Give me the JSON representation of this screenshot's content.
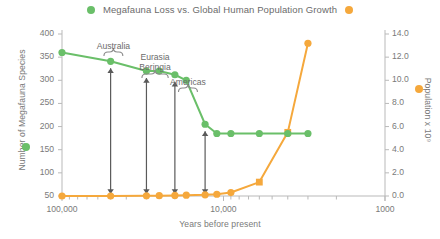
{
  "title": "Megafauna Loss vs. Global Human Population Growth",
  "colors": {
    "green": "#6abf69",
    "orange": "#f5a83c",
    "arrow": "#5a5a5a",
    "text": "#7a7a7a"
  },
  "legend": {
    "left_marker": "green-dot-icon",
    "right_marker": "orange-dot-icon"
  },
  "axes": {
    "xlabel": "Years before present",
    "ylabel_left": "Number of Megafauna Species",
    "ylabel_right": "Population x 10⁹",
    "x_ticks": [
      "100,000",
      "10,000",
      "1000"
    ],
    "y_ticks_left": [
      "400",
      "350",
      "300",
      "250",
      "200",
      "150",
      "100",
      "50"
    ],
    "y_ticks_right": [
      "14.0",
      "12.0",
      "10.0",
      "8.0",
      "6.0",
      "4.0",
      "2.0",
      "0.0"
    ]
  },
  "annotations": [
    {
      "label": "Australia",
      "line2": ""
    },
    {
      "label": "Eurasia",
      "line2": "Beringia"
    },
    {
      "label": "Americas",
      "line2": ""
    }
  ],
  "chart_data": {
    "type": "line",
    "title": "Megafauna Loss vs. Global Human Population Growth",
    "xlabel": "Years before present",
    "xscale": "log",
    "x_reversed": true,
    "xlim": [
      100000,
      1000
    ],
    "grid": false,
    "legend_position": "top-center",
    "x": [
      100000,
      50000,
      30000,
      25000,
      20000,
      17000,
      13000,
      11000,
      9000,
      6000,
      4000,
      3000
    ],
    "series": [
      {
        "name": "Number of Megafauna Species",
        "color": "#6abf69",
        "axis": "left",
        "ylabel": "Number of Megafauna Species",
        "ylim": [
          50,
          400
        ],
        "values": [
          360,
          341,
          320,
          320,
          312,
          300,
          205,
          185,
          185,
          185,
          185,
          185
        ]
      },
      {
        "name": "Population x 10⁹",
        "color": "#f5a83c",
        "axis": "right",
        "ylabel": "Population x 10⁹",
        "ylim": [
          0.0,
          14.0
        ],
        "values": [
          0.0,
          0.0,
          0.02,
          0.03,
          0.05,
          0.07,
          0.1,
          0.15,
          0.3,
          1.2,
          5.5,
          13.2
        ]
      }
    ],
    "annotations": [
      {
        "text": "Australia",
        "x_range": [
          55000,
          42000
        ]
      },
      {
        "text": "Eurasia Beringia",
        "x_range": [
          32000,
          22000
        ]
      },
      {
        "text": "Americas",
        "x_range": [
          19000,
          14500
        ]
      }
    ],
    "arrows": [
      {
        "x": 50000,
        "from": 341,
        "to": 50,
        "style": "double-headed"
      },
      {
        "x": 30000,
        "from": 320,
        "to": 50,
        "style": "double-headed"
      },
      {
        "x": 20000,
        "from": 312,
        "to": 50,
        "style": "double-headed"
      },
      {
        "x": 13000,
        "from": 205,
        "to": 50,
        "style": "double-headed"
      }
    ]
  }
}
